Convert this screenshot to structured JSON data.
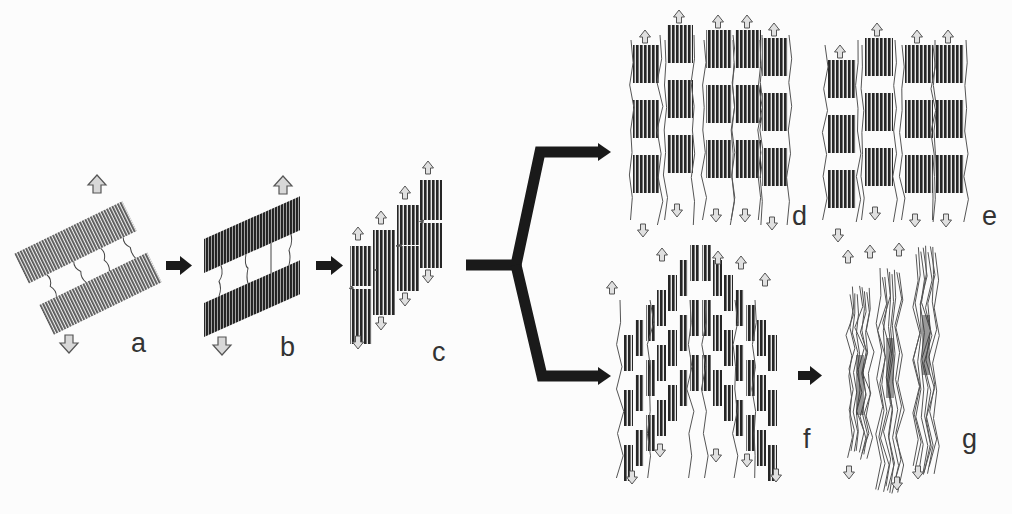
{
  "diagram": {
    "type": "process-flow",
    "colors": {
      "background": "#fcfcfc",
      "lamella_dark": "#2a2a2a",
      "lamella_mid": "#6a6a6a",
      "flow_arrow": "#1a1a1a",
      "load_arrow_fill": "#d8d8d8",
      "load_arrow_stroke": "#555555",
      "label": "#333333"
    },
    "stages": [
      {
        "id": "a",
        "label": "a",
        "description": "tilted lamellar stack with tie chains, light texture"
      },
      {
        "id": "b",
        "label": "b",
        "description": "tilted stack, denser/dark texture, stretched tie chains"
      },
      {
        "id": "c",
        "label": "c",
        "description": "lamellae fragmented into stepped blocks"
      },
      {
        "id": "d",
        "label": "d",
        "description": "parallel columns of block stacks with fibrils"
      },
      {
        "id": "e",
        "label": "e",
        "description": "aligned column stacks"
      },
      {
        "id": "f",
        "label": "f",
        "description": "chevron-shaped block arrangement with fibrils"
      },
      {
        "id": "g",
        "label": "g",
        "description": "fully fibrillar microfibrils"
      }
    ],
    "flow": [
      {
        "from": "a",
        "to": "b"
      },
      {
        "from": "b",
        "to": "c"
      },
      {
        "from": "c",
        "to": "branch"
      },
      {
        "from": "branch",
        "to": "d"
      },
      {
        "from": "branch",
        "to": "f"
      },
      {
        "from": "f",
        "to": "g"
      }
    ]
  }
}
